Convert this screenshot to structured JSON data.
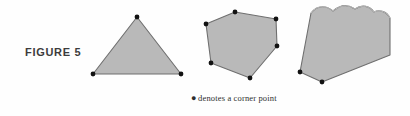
{
  "figure": {
    "label": "FIGURE 5",
    "caption_bullet": "●",
    "caption_text": "denotes a corner point",
    "background_color": "#fefefe",
    "shape_fill_color": "#b9b9b9",
    "shape_stroke_color": "#6f6f6f",
    "corner_dot_color": "#121212",
    "label_color": "#3c3c3c",
    "caption_color": "#2e2e2e"
  },
  "shapes": [
    {
      "name": "triangle",
      "corner_point_count": 3,
      "has_curved_edge": false,
      "outline_points": "137,17 181,74 93,74",
      "corner_points": [
        {
          "x": 137,
          "y": 17
        },
        {
          "x": 181,
          "y": 74
        },
        {
          "x": 93,
          "y": 74
        }
      ]
    },
    {
      "name": "hexagon",
      "corner_point_count": 6,
      "has_curved_edge": false,
      "outline_points": "235,12 276,19 277,46 250,78 211,63 206,24",
      "corner_points": [
        {
          "x": 235,
          "y": 12
        },
        {
          "x": 276,
          "y": 19
        },
        {
          "x": 277,
          "y": 46
        },
        {
          "x": 250,
          "y": 78
        },
        {
          "x": 211,
          "y": 63
        },
        {
          "x": 206,
          "y": 24
        }
      ]
    },
    {
      "name": "wavy-top-wedge",
      "corner_point_count": 2,
      "has_curved_edge": true,
      "wavy_edge_path": "M 311,13 C 318,4 327,6 333,11 C 340,5 348,4 355,9 C 362,4 370,6 374,12 C 380,9 387,12 390,18",
      "outline_path": "M 311,13 C 318,4 327,6 333,11 C 340,5 348,4 355,9 C 362,4 370,6 374,12 C 380,9 387,12 390,18 L 390,55 L 322,82 L 300,72 Z",
      "corner_points": [
        {
          "x": 300,
          "y": 72
        },
        {
          "x": 322,
          "y": 82
        }
      ]
    }
  ]
}
